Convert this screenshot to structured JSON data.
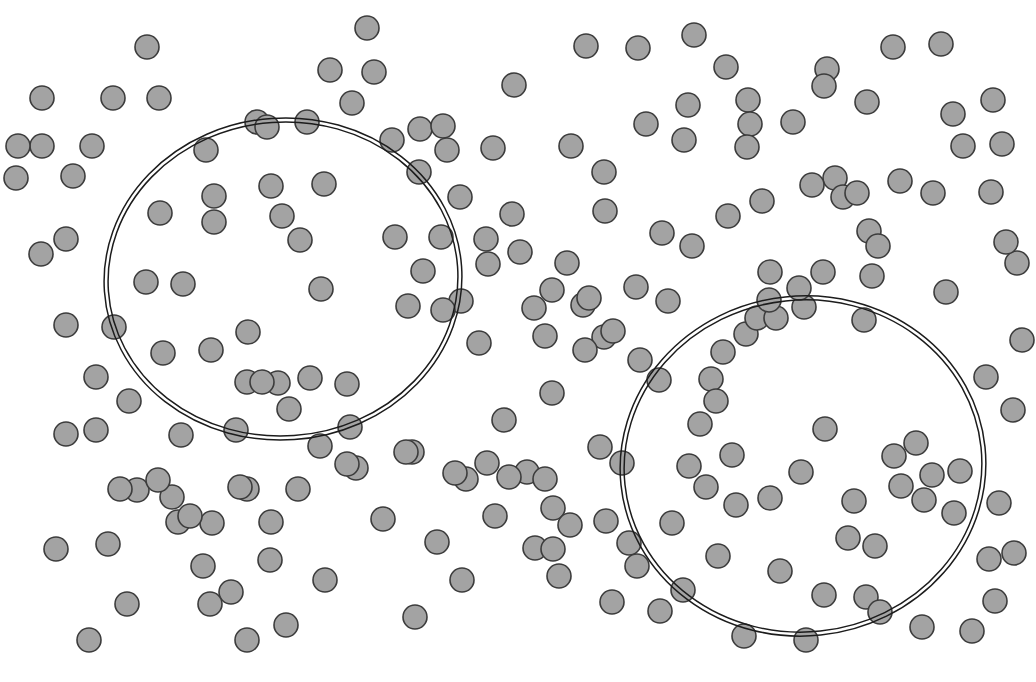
{
  "figure": {
    "width": 1036,
    "height": 682,
    "background_color": "#ffffff"
  },
  "style": {
    "point_fill": "#a3a3a3",
    "point_stroke": "#3c3c3c",
    "point_stroke_width": 1.6,
    "point_radius": 12,
    "boundary_stroke": "#1c1c1c",
    "boundary_stroke_width": 1.5,
    "boundary_gap": 4
  },
  "chart_data": {
    "type": "scatter",
    "xlabel": "",
    "ylabel": "",
    "xlim": [
      0,
      1036
    ],
    "ylim": [
      0,
      682
    ],
    "grid": false,
    "legend": "none",
    "marker": "circle",
    "marker_size": 24,
    "point_count": 212,
    "cluster_count": 2,
    "annotations": [
      {
        "name": "left-cluster-boundary",
        "shape": "ellipse",
        "cx": 283,
        "cy": 279,
        "rx": 179,
        "ry": 161,
        "rotation_deg": -4,
        "style": "double-line"
      },
      {
        "name": "right-cluster-boundary",
        "shape": "ellipse",
        "cx": 803,
        "cy": 466,
        "rx": 183,
        "ry": 170,
        "rotation_deg": -6,
        "style": "double-line"
      }
    ],
    "points": [
      [
        147,
        47
      ],
      [
        113,
        98
      ],
      [
        159,
        98
      ],
      [
        42,
        146
      ],
      [
        92,
        146
      ],
      [
        73,
        176
      ],
      [
        66,
        239
      ],
      [
        66,
        325
      ],
      [
        96,
        430
      ],
      [
        56,
        549
      ],
      [
        108,
        544
      ],
      [
        137,
        490
      ],
      [
        172,
        497
      ],
      [
        178,
        522
      ],
      [
        212,
        523
      ],
      [
        203,
        566
      ],
      [
        231,
        592
      ],
      [
        127,
        604
      ],
      [
        89,
        640
      ],
      [
        247,
        489
      ],
      [
        270,
        560
      ],
      [
        181,
        435
      ],
      [
        114,
        327
      ],
      [
        129,
        401
      ],
      [
        41,
        254
      ],
      [
        16,
        178
      ],
      [
        257,
        122
      ],
      [
        307,
        122
      ],
      [
        267,
        127
      ],
      [
        206,
        150
      ],
      [
        330,
        70
      ],
      [
        374,
        72
      ],
      [
        352,
        103
      ],
      [
        392,
        140
      ],
      [
        420,
        129
      ],
      [
        271,
        186
      ],
      [
        324,
        184
      ],
      [
        214,
        196
      ],
      [
        214,
        222
      ],
      [
        282,
        216
      ],
      [
        300,
        240
      ],
      [
        248,
        332
      ],
      [
        211,
        350
      ],
      [
        321,
        289
      ],
      [
        146,
        282
      ],
      [
        183,
        284
      ],
      [
        160,
        213
      ],
      [
        278,
        383
      ],
      [
        247,
        382
      ],
      [
        262,
        382
      ],
      [
        310,
        378
      ],
      [
        347,
        384
      ],
      [
        289,
        409
      ],
      [
        236,
        430
      ],
      [
        320,
        446
      ],
      [
        350,
        427
      ],
      [
        395,
        237
      ],
      [
        441,
        237
      ],
      [
        423,
        271
      ],
      [
        461,
        301
      ],
      [
        412,
        452
      ],
      [
        356,
        468
      ],
      [
        298,
        489
      ],
      [
        460,
        197
      ],
      [
        493,
        148
      ],
      [
        514,
        85
      ],
      [
        488,
        264
      ],
      [
        520,
        252
      ],
      [
        534,
        308
      ],
      [
        545,
        336
      ],
      [
        552,
        393
      ],
      [
        504,
        420
      ],
      [
        527,
        472
      ],
      [
        553,
        508
      ],
      [
        466,
        479
      ],
      [
        495,
        516
      ],
      [
        535,
        548
      ],
      [
        559,
        576
      ],
      [
        462,
        580
      ],
      [
        415,
        617
      ],
      [
        487,
        463
      ],
      [
        571,
        146
      ],
      [
        605,
        211
      ],
      [
        586,
        46
      ],
      [
        638,
        48
      ],
      [
        646,
        124
      ],
      [
        694,
        35
      ],
      [
        726,
        67
      ],
      [
        688,
        105
      ],
      [
        684,
        140
      ],
      [
        728,
        216
      ],
      [
        748,
        100
      ],
      [
        750,
        124
      ],
      [
        747,
        147
      ],
      [
        793,
        122
      ],
      [
        827,
        69
      ],
      [
        824,
        86
      ],
      [
        867,
        102
      ],
      [
        893,
        47
      ],
      [
        941,
        44
      ],
      [
        953,
        114
      ],
      [
        993,
        100
      ],
      [
        963,
        146
      ],
      [
        1002,
        144
      ],
      [
        900,
        181
      ],
      [
        835,
        178
      ],
      [
        843,
        197
      ],
      [
        857,
        193
      ],
      [
        812,
        185
      ],
      [
        762,
        201
      ],
      [
        770,
        272
      ],
      [
        823,
        272
      ],
      [
        872,
        276
      ],
      [
        933,
        193
      ],
      [
        946,
        292
      ],
      [
        991,
        192
      ],
      [
        604,
        172
      ],
      [
        636,
        287
      ],
      [
        668,
        301
      ],
      [
        604,
        337
      ],
      [
        640,
        360
      ],
      [
        585,
        350
      ],
      [
        552,
        290
      ],
      [
        583,
        305
      ],
      [
        659,
        380
      ],
      [
        689,
        466
      ],
      [
        700,
        424
      ],
      [
        711,
        379
      ],
      [
        746,
        334
      ],
      [
        757,
        318
      ],
      [
        776,
        318
      ],
      [
        804,
        307
      ],
      [
        864,
        320
      ],
      [
        723,
        352
      ],
      [
        769,
        300
      ],
      [
        799,
        288
      ],
      [
        716,
        401
      ],
      [
        732,
        455
      ],
      [
        825,
        429
      ],
      [
        894,
        456
      ],
      [
        916,
        443
      ],
      [
        932,
        475
      ],
      [
        901,
        486
      ],
      [
        924,
        500
      ],
      [
        960,
        471
      ],
      [
        954,
        513
      ],
      [
        999,
        503
      ],
      [
        989,
        559
      ],
      [
        1014,
        553
      ],
      [
        672,
        523
      ],
      [
        706,
        487
      ],
      [
        736,
        505
      ],
      [
        770,
        498
      ],
      [
        801,
        472
      ],
      [
        854,
        501
      ],
      [
        848,
        538
      ],
      [
        875,
        546
      ],
      [
        780,
        571
      ],
      [
        824,
        595
      ],
      [
        866,
        597
      ],
      [
        718,
        556
      ],
      [
        629,
        543
      ],
      [
        637,
        566
      ],
      [
        683,
        590
      ],
      [
        606,
        521
      ],
      [
        570,
        525
      ],
      [
        553,
        549
      ],
      [
        347,
        464
      ],
      [
        406,
        452
      ],
      [
        455,
        473
      ],
      [
        509,
        477
      ],
      [
        545,
        479
      ],
      [
        600,
        447
      ],
      [
        622,
        463
      ],
      [
        66,
        434
      ],
      [
        120,
        489
      ],
      [
        158,
        480
      ],
      [
        190,
        516
      ],
      [
        240,
        487
      ],
      [
        271,
        522
      ],
      [
        42,
        98
      ],
      [
        18,
        146
      ],
      [
        367,
        28
      ],
      [
        443,
        126
      ],
      [
        447,
        150
      ],
      [
        419,
        172
      ],
      [
        589,
        298
      ],
      [
        613,
        331
      ],
      [
        567,
        263
      ],
      [
        479,
        343
      ],
      [
        443,
        310
      ],
      [
        408,
        306
      ],
      [
        486,
        239
      ],
      [
        512,
        214
      ],
      [
        662,
        233
      ],
      [
        692,
        246
      ],
      [
        869,
        231
      ],
      [
        878,
        246
      ],
      [
        1017,
        263
      ],
      [
        1022,
        340
      ],
      [
        1013,
        410
      ],
      [
        986,
        377
      ],
      [
        1006,
        242
      ],
      [
        995,
        601
      ],
      [
        972,
        631
      ],
      [
        286,
        625
      ],
      [
        325,
        580
      ],
      [
        210,
        604
      ],
      [
        247,
        640
      ],
      [
        383,
        519
      ],
      [
        437,
        542
      ],
      [
        660,
        611
      ],
      [
        612,
        602
      ],
      [
        744,
        636
      ],
      [
        806,
        640
      ],
      [
        880,
        612
      ],
      [
        922,
        627
      ],
      [
        163,
        353
      ],
      [
        96,
        377
      ]
    ]
  }
}
